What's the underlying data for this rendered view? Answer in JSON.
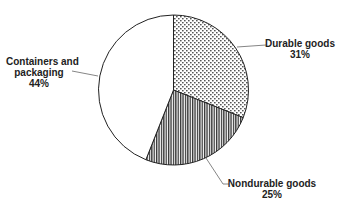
{
  "chart_data": {
    "type": "pie",
    "title": "",
    "categories": [
      "Durable goods",
      "Nondurable goods",
      "Containers and packaging"
    ],
    "values": [
      31,
      25,
      44
    ],
    "unit": "%",
    "start_angle_deg": 0,
    "direction": "clockwise",
    "slices": [
      {
        "label": "Durable goods",
        "value": 31,
        "percent_label": "31%",
        "fill_pattern": "dots"
      },
      {
        "label": "Nondurable goods",
        "value": 25,
        "percent_label": "25%",
        "fill_pattern": "vertical-stripes"
      },
      {
        "label": "Containers and packaging",
        "value": 44,
        "percent_label": "44%",
        "fill_pattern": "none"
      }
    ],
    "legend": "none (callout labels with leader lines)"
  },
  "labels": {
    "durable": {
      "line1": "Durable goods",
      "line2": "31%"
    },
    "nondurable": {
      "line1": "Nondurable goods",
      "line2": "25%"
    },
    "containers": {
      "line1": "Containers and",
      "line2": "packaging",
      "line3": "44%"
    }
  },
  "colors": {
    "outline": "#222222",
    "pattern": "#333333",
    "background": "#ffffff",
    "leader": "#666666"
  }
}
